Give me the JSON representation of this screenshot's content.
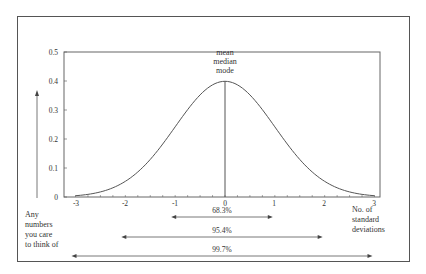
{
  "chart_data": {
    "type": "line",
    "title": "",
    "xlabel": "No. of standard deviations",
    "ylabel": "Any numbers you care to think of",
    "x_ticks": [
      "-3",
      "-2",
      "-1",
      "0",
      "1",
      "2",
      "3"
    ],
    "y_ticks": [
      "0",
      "0.1",
      "0.2",
      "0.3",
      "0.4",
      "0.5"
    ],
    "xlim": [
      -3,
      3
    ],
    "ylim": [
      0,
      0.5
    ],
    "grid": false,
    "series": [
      {
        "name": "Normal distribution",
        "x": [
          -3,
          -2.5,
          -2,
          -1.5,
          -1,
          -0.5,
          0,
          0.5,
          1,
          1.5,
          2,
          2.5,
          3
        ],
        "values": [
          0.004,
          0.018,
          0.054,
          0.13,
          0.242,
          0.352,
          0.399,
          0.352,
          0.242,
          0.13,
          0.054,
          0.018,
          0.004
        ]
      }
    ],
    "annotations": [
      {
        "text": "mean",
        "x": 0
      },
      {
        "text": "median",
        "x": 0
      },
      {
        "text": "mode",
        "x": 0
      }
    ],
    "ranges": [
      {
        "label": "68.3%",
        "from": -1,
        "to": 1
      },
      {
        "label": "95.4%",
        "from": -2,
        "to": 2
      },
      {
        "label": "99.7%",
        "from": -3,
        "to": 3
      }
    ]
  },
  "labels": {
    "center": [
      "mean",
      "median",
      "mode"
    ],
    "y_axis_note": [
      "Any",
      "numbers",
      "you care",
      "to think of"
    ],
    "x_axis_note": [
      "No. of",
      "standard",
      "deviations"
    ]
  },
  "colors": {
    "line": "#555555",
    "text": "#333333"
  }
}
